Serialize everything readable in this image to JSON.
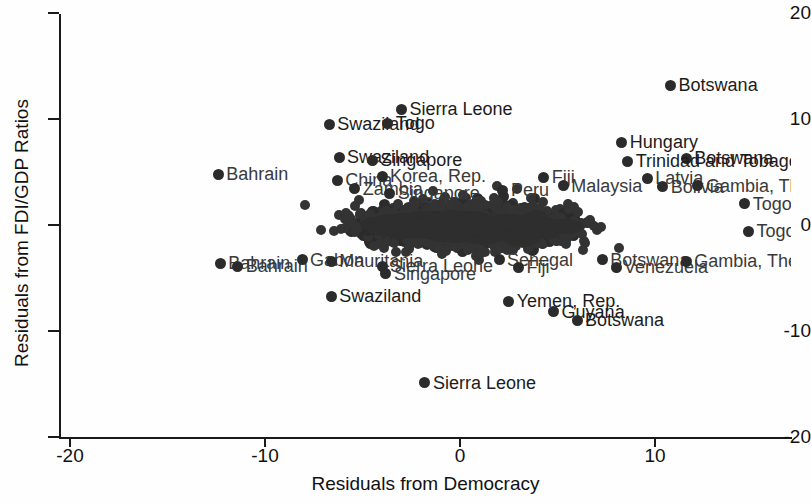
{
  "chart_data": {
    "type": "scatter",
    "title": "",
    "xlabel": "Residuals from Democracy",
    "ylabel": "Residuals from FDI/GDP Ratios",
    "xlim": [
      -21.5,
      16.5
    ],
    "ylim": [
      -21.5,
      21.5
    ],
    "xticks": [
      -20,
      -10,
      0,
      10
    ],
    "xticklabels": [
      "-20",
      "-10",
      "0",
      "10"
    ],
    "yticks": [
      20,
      10,
      0,
      -10,
      -20
    ],
    "yticklabels": [
      "20",
      "10",
      "0",
      "-10",
      "-20"
    ],
    "grid": false,
    "legend": null,
    "marker": "filled-circle",
    "marker_color": "#2b2b2b",
    "labeled_points": [
      {
        "label": "Botswana",
        "x": 10.8,
        "y": 13.2
      },
      {
        "label": "Sierra Leone",
        "x": -3.0,
        "y": 10.9
      },
      {
        "label": "Swaziland",
        "x": -6.7,
        "y": 9.5
      },
      {
        "label": "Togo",
        "x": -3.7,
        "y": 9.6
      },
      {
        "label": "Hungary",
        "x": 8.3,
        "y": 7.8
      },
      {
        "label": "Swaziland",
        "x": -6.2,
        "y": 6.4
      },
      {
        "label": "Singapore",
        "x": -4.5,
        "y": 6.1
      },
      {
        "label": "Botswana",
        "x": 11.6,
        "y": 6.3
      },
      {
        "label": "Trinidad and Tobago",
        "x": 8.6,
        "y": 6.0
      },
      {
        "label": "Bahrain",
        "x": -12.4,
        "y": 4.8
      },
      {
        "label": "China",
        "x": -6.3,
        "y": 4.2
      },
      {
        "label": "Korea, Rep.",
        "x": -4.0,
        "y": 4.6
      },
      {
        "label": "Latvia",
        "x": 9.6,
        "y": 4.4
      },
      {
        "label": "Bolivia",
        "x": 10.4,
        "y": 3.6
      },
      {
        "label": "Fiji",
        "x": 4.3,
        "y": 4.5
      },
      {
        "label": "Malaysia",
        "x": 5.3,
        "y": 3.7
      },
      {
        "label": "Peru",
        "x": 2.2,
        "y": 3.3
      },
      {
        "label": "Gambia, The",
        "x": 12.2,
        "y": 3.7
      },
      {
        "label": "Zambia",
        "x": -5.4,
        "y": 3.4
      },
      {
        "label": "Singapore",
        "x": -3.6,
        "y": 3.0
      },
      {
        "label": "Togo",
        "x": 14.6,
        "y": 2.0
      },
      {
        "label": "Togo",
        "x": 14.8,
        "y": -0.6
      },
      {
        "label": "Bahrain",
        "x": -12.3,
        "y": -3.6
      },
      {
        "label": "Bahrain",
        "x": -11.4,
        "y": -3.9
      },
      {
        "label": "Gabon",
        "x": -8.1,
        "y": -3.3
      },
      {
        "label": "Mauritania",
        "x": -6.6,
        "y": -3.4
      },
      {
        "label": "Sierra Leone",
        "x": -4.0,
        "y": -3.9
      },
      {
        "label": "Senegal",
        "x": 2.0,
        "y": -3.3
      },
      {
        "label": "Fiji",
        "x": 3.0,
        "y": -4.0
      },
      {
        "label": "Botswana",
        "x": 7.3,
        "y": -3.3
      },
      {
        "label": "Venezuela",
        "x": 8.0,
        "y": -4.0
      },
      {
        "label": "Gambia, The",
        "x": 11.6,
        "y": -3.4
      },
      {
        "label": "Singapore",
        "x": -3.8,
        "y": -4.6
      },
      {
        "label": "Swaziland",
        "x": -6.6,
        "y": -6.7
      },
      {
        "label": "Yemen, Rep.",
        "x": 2.5,
        "y": -7.2
      },
      {
        "label": "Guyana",
        "x": 4.8,
        "y": -8.2
      },
      {
        "label": "Botswana",
        "x": 6.0,
        "y": -9.0
      },
      {
        "label": "Sierra Leone",
        "x": -1.8,
        "y": -14.9
      }
    ]
  }
}
